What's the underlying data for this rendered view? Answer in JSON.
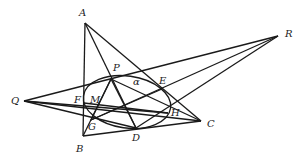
{
  "diagram": {
    "stroke_color": "#1a1a1a",
    "points": [
      {
        "id": "A",
        "x": 85,
        "y": 23,
        "lx": 79,
        "ly": 8
      },
      {
        "id": "B",
        "x": 83,
        "y": 136,
        "lx": 76,
        "ly": 144
      },
      {
        "id": "C",
        "x": 201,
        "y": 121,
        "lx": 207,
        "ly": 119
      },
      {
        "id": "D",
        "x": 136,
        "y": 128,
        "lx": 132,
        "ly": 133
      },
      {
        "id": "E",
        "x": 162,
        "y": 89,
        "lx": 159,
        "ly": 76
      },
      {
        "id": "F",
        "x": 84,
        "y": 103,
        "lx": 74,
        "ly": 95
      },
      {
        "id": "G",
        "x": 91,
        "y": 120,
        "lx": 88,
        "ly": 122
      },
      {
        "id": "H",
        "x": 168,
        "y": 113,
        "lx": 171,
        "ly": 108
      },
      {
        "id": "M",
        "x": 95,
        "y": 106,
        "lx": 90,
        "ly": 95
      },
      {
        "id": "P",
        "x": 111,
        "y": 79,
        "lx": 113,
        "ly": 63
      },
      {
        "id": "Q",
        "x": 24,
        "y": 101,
        "lx": 11,
        "ly": 96
      },
      {
        "id": "R",
        "x": 278,
        "y": 36,
        "lx": 285,
        "ly": 29
      }
    ],
    "angle_label": {
      "text": "α",
      "x": 133,
      "y": 77
    },
    "ellipse": {
      "cx": 127,
      "cy": 102,
      "rx": 44,
      "ry": 26,
      "rotate": 8
    },
    "segments": [
      [
        "A",
        "B"
      ],
      [
        "B",
        "C"
      ],
      [
        "A",
        "C"
      ],
      [
        "A",
        "D"
      ],
      [
        "Q",
        "R"
      ],
      [
        "R",
        "G"
      ],
      [
        "R",
        "D"
      ],
      [
        "Q",
        "C"
      ],
      [
        "Q",
        "D"
      ],
      [
        "Q",
        "H"
      ],
      [
        "P",
        "D"
      ],
      [
        "P",
        "G"
      ],
      [
        "P",
        "C"
      ],
      [
        "F",
        "H"
      ],
      [
        "G",
        "E"
      ],
      [
        "B",
        "P"
      ]
    ]
  }
}
